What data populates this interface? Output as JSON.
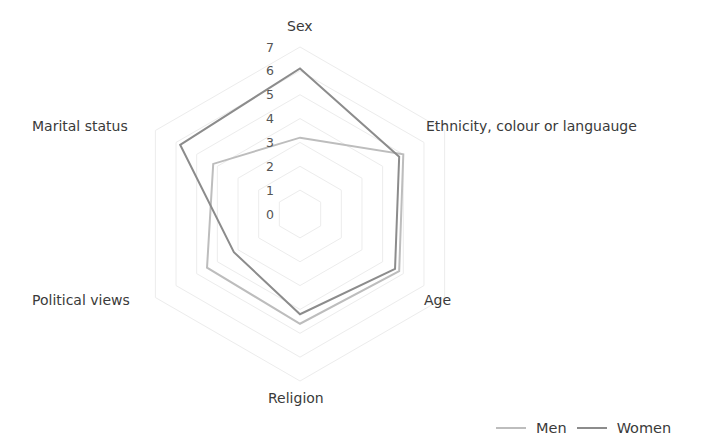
{
  "chart_data": {
    "type": "radar",
    "title": "",
    "categories": [
      "Sex",
      "Ethnicity, colour or languauge",
      "Age",
      "Religion",
      "Political views",
      "Marital status"
    ],
    "series": [
      {
        "name": "Men",
        "color": "#bdbdbd",
        "values": [
          3.2,
          5.0,
          4.8,
          4.6,
          4.5,
          4.2
        ]
      },
      {
        "name": "Women",
        "color": "#8c8c8c",
        "values": [
          6.1,
          4.8,
          4.6,
          4.2,
          3.2,
          5.8
        ]
      }
    ],
    "radial_ticks": [
      "0",
      "1",
      "2",
      "3",
      "4",
      "5",
      "6",
      "7"
    ],
    "rlim": [
      0,
      7
    ],
    "grid": true,
    "gridline_color": "#ececec",
    "legend_position": "bottom-right"
  },
  "legend": {
    "items": [
      {
        "label": "Men",
        "color": "#bdbdbd"
      },
      {
        "label": "Women",
        "color": "#8c8c8c"
      }
    ]
  }
}
